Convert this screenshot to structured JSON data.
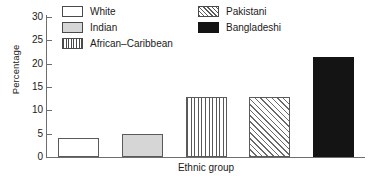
{
  "chart_data": {
    "type": "bar",
    "title": "",
    "xlabel": "Ethnic group",
    "ylabel": "Percentage",
    "categories": [
      "White",
      "Indian",
      "African–Caribbean",
      "Pakistani",
      "Bangladeshi"
    ],
    "values": [
      4,
      5,
      12.8,
      12.8,
      21.5
    ],
    "ylim": [
      0,
      30
    ],
    "yticks": [
      0,
      5,
      10,
      15,
      20,
      25,
      30
    ],
    "ytick_labels": [
      "0",
      "5",
      "10",
      "15",
      "20",
      "25",
      "30"
    ],
    "grid": false,
    "legend_position": "top-inside",
    "series": [
      {
        "name": "Percentage",
        "values": [
          4,
          5,
          12.8,
          12.8,
          21.5
        ]
      }
    ]
  },
  "legend": {
    "items": [
      {
        "label": "White",
        "pattern": "white"
      },
      {
        "label": "Indian",
        "pattern": "gray"
      },
      {
        "label": "African–Caribbean",
        "pattern": "vstripe"
      },
      {
        "label": "Pakistani",
        "pattern": "dhatch"
      },
      {
        "label": "Bangladeshi",
        "pattern": "black"
      }
    ]
  },
  "bars": [
    {
      "label": "White",
      "value": 4,
      "pattern": "white"
    },
    {
      "label": "Indian",
      "value": 5,
      "pattern": "gray"
    },
    {
      "label": "African–Caribbean",
      "value": 12.8,
      "pattern": "vstripe"
    },
    {
      "label": "Pakistani",
      "value": 12.8,
      "pattern": "dhatch"
    },
    {
      "label": "Bangladeshi",
      "value": 21.5,
      "pattern": "black"
    }
  ],
  "axis": {
    "y_ticks": [
      "30",
      "25",
      "20",
      "15",
      "10",
      "5",
      "0"
    ]
  }
}
